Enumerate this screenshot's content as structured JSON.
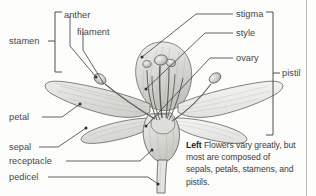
{
  "figure": {
    "subject": "flower",
    "style": "grayscale botanical line illustration",
    "background_color": "#fdfdfc",
    "line_color": "#3a3a3a",
    "petal_fill": "#d9d9d5",
    "petal_fill_light": "#ececeb",
    "label_color": "#454545"
  },
  "labels": {
    "anther": "anther",
    "filament": "filament",
    "stamen": "stamen",
    "petal": "petal",
    "sepal": "sepal",
    "receptacle": "receptacle",
    "pedicel": "pedicel",
    "stigma": "stigma",
    "style": "style",
    "ovary": "ovary",
    "pistil": "pistil"
  },
  "brackets": {
    "stamen_group": [
      "anther",
      "filament"
    ],
    "pistil_group": [
      "stigma",
      "style",
      "ovary"
    ]
  },
  "caption": {
    "lead": "Left",
    "text": "Flowers vary greatly, but most are composed of sepals, petals, stamens, and pistils."
  }
}
